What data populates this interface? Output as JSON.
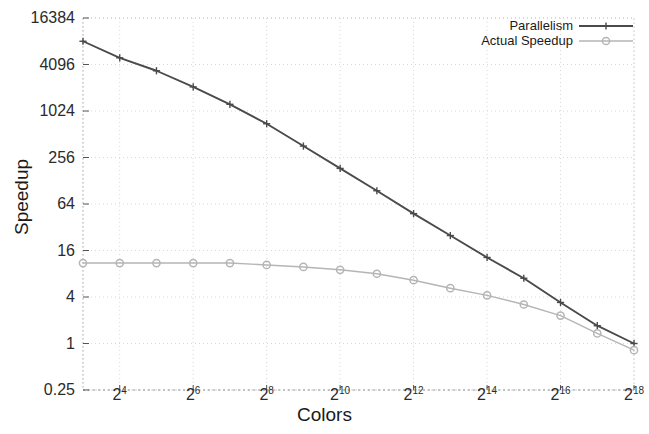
{
  "chart_data": {
    "type": "line",
    "title": "",
    "xlabel": "Colors",
    "ylabel": "Speedup",
    "xscale": "log2",
    "yscale": "log4",
    "grid": true,
    "legend_position": "top-right",
    "xtick_labels": [
      "2⁴",
      "2⁶",
      "2⁸",
      "2¹⁰",
      "2¹²",
      "2¹⁴",
      "2¹⁶",
      "2¹⁸"
    ],
    "xticks_base": [
      4,
      6,
      8,
      10,
      12,
      14,
      16,
      18
    ],
    "xtick_mantissa": [
      "2",
      "2",
      "2",
      "2",
      "2",
      "2",
      "2",
      "2"
    ],
    "xtick_exponent": [
      "4",
      "6",
      "8",
      "10",
      "12",
      "14",
      "16",
      "18"
    ],
    "ytick_labels": [
      "16384",
      "4096",
      "1024",
      "256",
      "64",
      "16",
      "4",
      "1",
      "0.25"
    ],
    "ytick_values": [
      16384,
      4096,
      1024,
      256,
      64,
      16,
      4,
      1,
      0.25
    ],
    "xlim": [
      3,
      18
    ],
    "ylim": [
      0.25,
      16384
    ],
    "x": [
      3,
      4,
      5,
      6,
      7,
      8,
      9,
      10,
      11,
      12,
      13,
      14,
      15,
      16,
      17,
      18
    ],
    "series": [
      {
        "name": "Parallelism",
        "color": "#4a4a4a",
        "marker": "plus",
        "values": [
          8192,
          5000,
          3400,
          2100,
          1250,
          700,
          360,
          185,
          95,
          48,
          25,
          13,
          7.0,
          3.4,
          1.7,
          1.0
        ]
      },
      {
        "name": "Actual Speedup",
        "color": "#b5b5b5",
        "marker": "circle",
        "values": [
          11.0,
          11.0,
          11.0,
          11.0,
          11.0,
          10.4,
          9.8,
          9.0,
          8.0,
          6.6,
          5.2,
          4.2,
          3.2,
          2.3,
          1.35,
          0.82
        ]
      }
    ]
  },
  "legend": {
    "entries": [
      {
        "label": "Parallelism"
      },
      {
        "label": "Actual Speedup"
      }
    ]
  },
  "axes": {
    "y_title": "Speedup",
    "x_title": "Colors"
  }
}
